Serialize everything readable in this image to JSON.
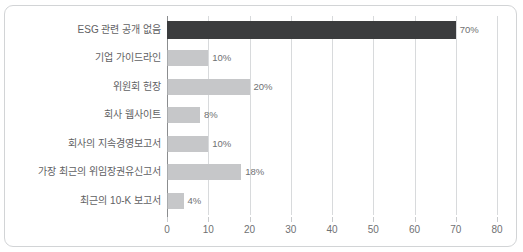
{
  "chart_data": {
    "type": "bar",
    "orientation": "horizontal",
    "title": "",
    "xlabel": "",
    "ylabel": "",
    "xlim": [
      0,
      80
    ],
    "xticks": [
      0,
      10,
      20,
      30,
      40,
      50,
      60,
      70,
      80
    ],
    "grid": true,
    "legend": false,
    "categories": [
      "ESG 관련 공개 없음",
      "기업 가이드라인",
      "위원회 헌장",
      "회사 웹사이트",
      "회사의 지속경영보고서",
      "가장 최근의 위임장권유신고서",
      "최근의 10-K 보고서"
    ],
    "values": [
      70,
      10,
      20,
      8,
      10,
      18,
      4
    ],
    "value_labels": [
      "70%",
      "10%",
      "20%",
      "8%",
      "10%",
      "18%",
      "4%"
    ],
    "colors": {
      "highlight_bar": "#3b3c3e",
      "bar": "#c6c7c9",
      "gridline": "#d8dadc",
      "axis": "#8b8d8f",
      "text": "#5f6163",
      "frame": "#d2d4d6"
    },
    "highlight_index": 0
  }
}
